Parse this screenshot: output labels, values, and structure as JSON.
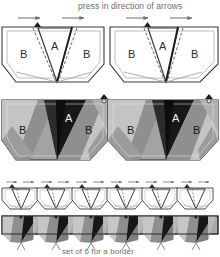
{
  "figure": {
    "header_caption": "press in direction of arrows",
    "footer_caption": "set of 6 for a border",
    "label_a": "A",
    "label_b": "B",
    "border_unit_count": 6
  },
  "colors": {
    "line": "#3a3a3a",
    "thin_line": "#9a9a9a",
    "dash": "#5a5a5a",
    "caption_text": "#6e6e6e",
    "panel_white": "#ffffff",
    "shade_dark": "#141414",
    "shade_dark2": "#2e2e2e",
    "shade_mid": "#8c8c8c",
    "shade_mid2": "#7a7a7a",
    "shade_light": "#b7b7b7",
    "shade_light2": "#a3a3a3",
    "shade_pale": "#cccccc",
    "label_light": "#f2f2f2"
  },
  "rows": {
    "line_diagrams": {
      "name": "line-art folding diagrams",
      "count": 2,
      "arrows_per_unit": 2,
      "arrow_direction": "right",
      "labels": [
        "B",
        "A",
        "B"
      ]
    },
    "shaded_diagrams": {
      "name": "shaded folding diagrams",
      "count": 2,
      "labels": [
        "B",
        "A",
        "B"
      ]
    },
    "strip_line": {
      "name": "six unit line strip",
      "count": 6,
      "arrows_per_unit": 2
    },
    "strip_shaded": {
      "name": "six unit shaded border strip",
      "count": 6
    }
  }
}
